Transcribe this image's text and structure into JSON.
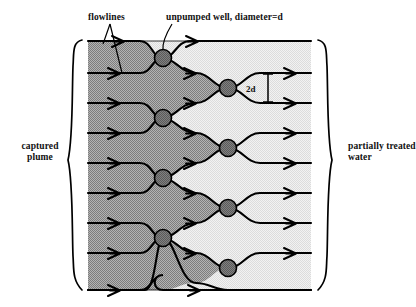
{
  "figure": {
    "kind": "groundwater-remediation-flowline-diagram",
    "title": "",
    "annotations": {
      "flowlines_label": "flowlines",
      "well_label": "unpumped well, diameter=d",
      "spacing_label": "2d",
      "left_bracket_label": "captured plume",
      "right_bracket_label": "partially treated water"
    },
    "colors": {
      "plume_shade": "#9c9c9c",
      "treated_shade": "#e9e9e9",
      "well_fill": "#6e6e6e",
      "line": "#000000",
      "background": "#ffffff"
    },
    "geometry": {
      "domain": {
        "x_left": 88,
        "x_right": 311,
        "y_top": 41,
        "y_bottom": 290
      },
      "well_radius": 8.5,
      "wells": [
        {
          "id": "w1",
          "column": "left",
          "x": 163,
          "y": 58
        },
        {
          "id": "w2",
          "column": "right",
          "x": 228,
          "y": 88
        },
        {
          "id": "w3",
          "column": "left",
          "x": 163,
          "y": 118
        },
        {
          "id": "w4",
          "column": "right",
          "x": 228,
          "y": 148
        },
        {
          "id": "w5",
          "column": "left",
          "x": 163,
          "y": 178
        },
        {
          "id": "w6",
          "column": "right",
          "x": 228,
          "y": 208
        },
        {
          "id": "w7",
          "column": "left",
          "x": 163,
          "y": 238
        },
        {
          "id": "w8",
          "column": "right",
          "x": 228,
          "y": 268
        }
      ],
      "flowline_inlet_y": [
        41,
        73,
        103,
        133,
        163,
        193,
        223,
        253,
        290
      ],
      "dimension_line": {
        "x": 268,
        "y_top": 73,
        "y_bottom": 103
      }
    }
  }
}
